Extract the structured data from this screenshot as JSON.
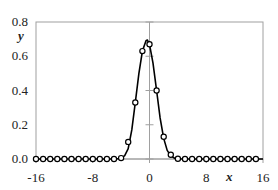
{
  "chart_data": {
    "type": "line",
    "title": "",
    "xlabel": "x",
    "ylabel": "y",
    "xlim": [
      -16,
      16
    ],
    "ylim": [
      0.0,
      0.8
    ],
    "x_ticks": [
      -16,
      -8,
      0,
      8,
      16
    ],
    "x_tick_labels": [
      "-16",
      "-8",
      "0",
      "8",
      "16"
    ],
    "y_ticks": [
      0.0,
      0.2,
      0.4,
      0.6,
      0.8
    ],
    "y_tick_labels": [
      "0.0",
      "0.2",
      "0.4",
      "0.6",
      "0.8"
    ],
    "grid": false,
    "legend": null,
    "series": [
      {
        "name": "curve",
        "style": "solid-line",
        "x": [
          -16,
          -15,
          -14,
          -13,
          -12,
          -11,
          -10,
          -9,
          -8,
          -7,
          -6,
          -5,
          -4,
          -3.5,
          -3,
          -2.5,
          -2,
          -1.5,
          -1,
          -0.5,
          -0.3,
          0,
          0.5,
          1,
          1.5,
          2,
          2.5,
          3,
          3.5,
          4,
          5,
          6,
          7,
          8,
          9,
          10,
          11,
          12,
          13,
          14,
          15,
          16
        ],
        "values": [
          0,
          0,
          0,
          0,
          0,
          0,
          0,
          0,
          0,
          0,
          0,
          0,
          0.003,
          0.02,
          0.06,
          0.17,
          0.33,
          0.5,
          0.63,
          0.69,
          0.695,
          0.67,
          0.56,
          0.4,
          0.24,
          0.12,
          0.05,
          0.018,
          0.005,
          0.001,
          0,
          0,
          0,
          0,
          0,
          0,
          0,
          0,
          0,
          0,
          0,
          0
        ]
      },
      {
        "name": "markers",
        "style": "open-circle",
        "x": [
          -16,
          -15,
          -14,
          -13,
          -12,
          -11,
          -10,
          -9,
          -8,
          -7,
          -6,
          -5,
          -4,
          -3,
          -2,
          -1,
          0,
          1,
          2,
          3,
          4,
          5,
          6,
          7,
          8,
          9,
          10,
          11,
          12,
          13,
          14,
          15
        ],
        "values": [
          0,
          0,
          0,
          0,
          0,
          0,
          0,
          0,
          0,
          0,
          0,
          0,
          0.005,
          0.1,
          0.33,
          0.63,
          0.67,
          0.4,
          0.13,
          0.025,
          0.002,
          0,
          0,
          0,
          0,
          0,
          0,
          0,
          0,
          0,
          0,
          0
        ]
      }
    ]
  }
}
